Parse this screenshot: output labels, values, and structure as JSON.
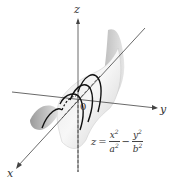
{
  "diagram": {
    "axes": {
      "x_label": "x",
      "y_label": "y",
      "z_label": "z",
      "origin_label": "0"
    },
    "equation": {
      "lhs": "z",
      "equals": "=",
      "term1_num": "x",
      "term1_den": "a",
      "minus": "−",
      "term2_num": "y",
      "term2_den": "b",
      "exponent": "2"
    },
    "colors": {
      "surface_light": "#f0f0f0",
      "surface_shade": "#b8b8b8",
      "axis": "#444444",
      "curve": "#111111"
    }
  }
}
